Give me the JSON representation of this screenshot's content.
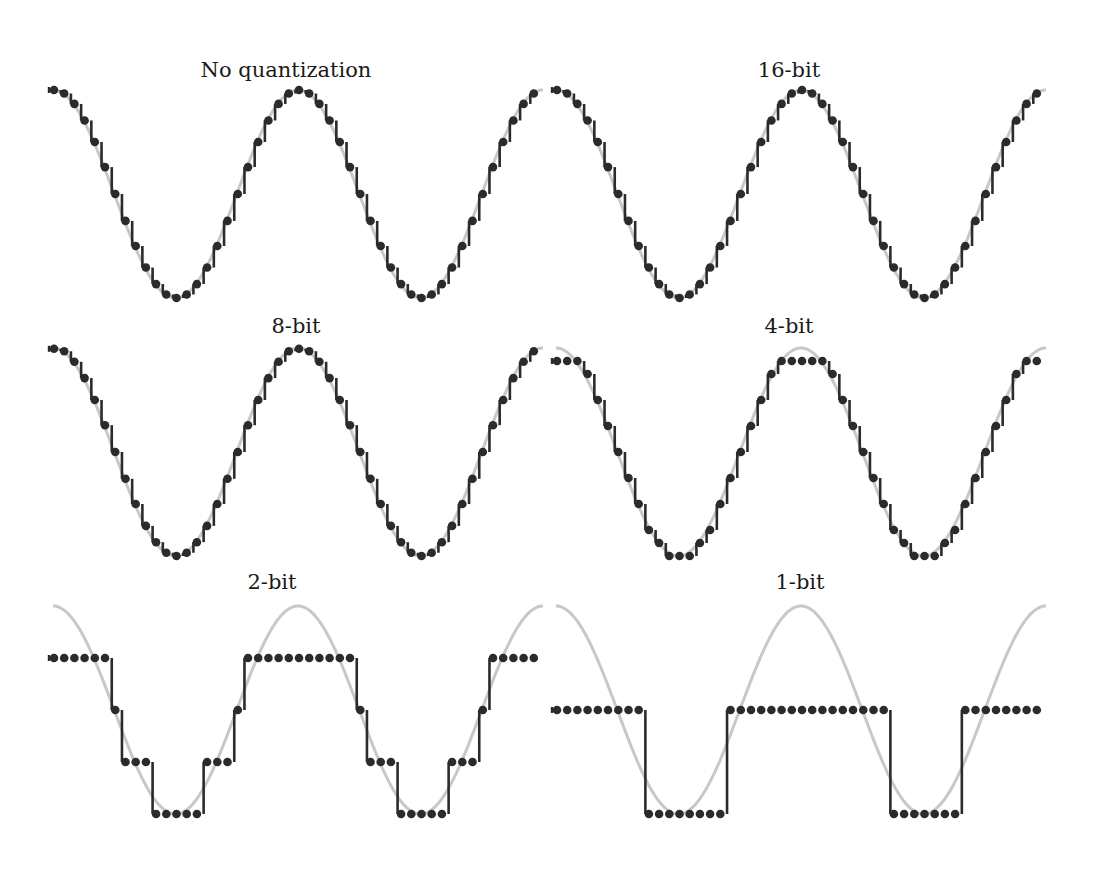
{
  "chart_data": {
    "type": "line",
    "title": "",
    "grid": false,
    "legend": null,
    "colors": {
      "reference_sine": "#c8c8c8",
      "samples": "#2b2b2b",
      "hold": "#2b2b2b"
    },
    "samples_per_period": 24,
    "periods_shown": 2,
    "panels": [
      {
        "id": "none",
        "title": "No quantization",
        "bits": null,
        "row": 0,
        "col": 0,
        "levels_note": "continuous"
      },
      {
        "id": "b16",
        "title": "16-bit",
        "bits": 16,
        "row": 0,
        "col": 1,
        "levels_note": "65536 levels"
      },
      {
        "id": "b8",
        "title": "8-bit",
        "bits": 8,
        "row": 1,
        "col": 0,
        "levels_note": "256 levels"
      },
      {
        "id": "b4",
        "title": "4-bit",
        "bits": 4,
        "row": 1,
        "col": 1,
        "levels_note": "16 levels, peak clipped at 7/8"
      },
      {
        "id": "b2",
        "title": "2-bit",
        "bits": 2,
        "row": 2,
        "col": 0,
        "levels_note": "4 levels: +0.5, 0, -0.5, -1"
      },
      {
        "id": "b1",
        "title": "1-bit",
        "bits": 1,
        "row": 2,
        "col": 1,
        "levels_note": "2 levels: 0, -1"
      }
    ]
  },
  "layout": {
    "cols": [
      {
        "x0": 53,
        "title_x": 286
      },
      {
        "x0": 556,
        "title_x": 789
      }
    ],
    "rows": [
      {
        "center_y": 194,
        "title_y": 58
      },
      {
        "center_y": 452,
        "title_y": 314
      },
      {
        "center_y": 710,
        "title_y": 570
      }
    ],
    "amplitude": 104,
    "period_px": 245,
    "n_samples": 48,
    "curve_width": 490
  }
}
